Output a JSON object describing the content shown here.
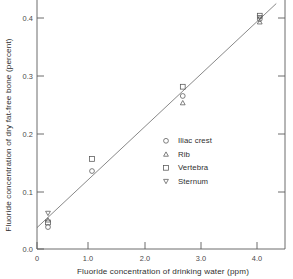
{
  "chart_data": {
    "type": "scatter",
    "title": "",
    "xlabel": "Fluoride concentration of drinking water (ppm)",
    "ylabel": "Fluoride concentration of dry fat-free bone (percent)",
    "xlim": [
      0,
      4.35
    ],
    "ylim": [
      0.0,
      0.425
    ],
    "xticks": [
      0,
      1.0,
      2.0,
      3.0,
      4.0
    ],
    "xticklabels": [
      "0",
      "1.0",
      "2.0",
      "3.0",
      "4.0"
    ],
    "yticks": [
      0.0,
      0.1,
      0.2,
      0.3,
      0.4
    ],
    "yticklabels": [
      "0.0",
      "0.1",
      "0.2",
      "0.3",
      "0.4"
    ],
    "grid": false,
    "legend_position": "center-right",
    "series": [
      {
        "name": "Iliac crest",
        "marker": "circle",
        "points": [
          [
            0.2,
            0.038
          ],
          [
            1.0,
            0.135
          ],
          [
            2.65,
            0.265
          ],
          [
            4.05,
            0.398
          ]
        ]
      },
      {
        "name": "Rib",
        "marker": "triangle-up",
        "points": [
          [
            0.2,
            0.05
          ],
          [
            2.65,
            0.253
          ],
          [
            4.05,
            0.393
          ]
        ]
      },
      {
        "name": "Vertebra",
        "marker": "square",
        "points": [
          [
            0.2,
            0.046
          ],
          [
            1.0,
            0.156
          ],
          [
            2.65,
            0.281
          ],
          [
            4.05,
            0.404
          ]
        ]
      },
      {
        "name": "Sternum",
        "marker": "triangle-down",
        "points": [
          [
            0.2,
            0.062
          ],
          [
            4.05,
            0.401
          ]
        ]
      }
    ],
    "fit_line": {
      "type": "line",
      "x": [
        0.0,
        4.35
      ],
      "y": [
        0.037,
        0.425
      ]
    }
  },
  "axes": {
    "x_title": "Fluoride concentration of drinking water (ppm)",
    "y_title": "Fluoride concentration of dry fat-free bone (percent)",
    "x_tick_labels": [
      "0",
      "1.0",
      "2.0",
      "3.0",
      "4.0"
    ],
    "y_tick_labels": [
      "0.0",
      "0.1",
      "0.2",
      "0.3",
      "0.4"
    ]
  },
  "legend": {
    "items": [
      {
        "label": "Iliac crest",
        "marker": "circle-marker-icon"
      },
      {
        "label": "Rib",
        "marker": "triangle-up-marker-icon"
      },
      {
        "label": "Vertebra",
        "marker": "square-marker-icon"
      },
      {
        "label": "Sternum",
        "marker": "triangle-down-marker-icon"
      }
    ]
  },
  "colors": {
    "axis": "#5c5c5c",
    "marker": "#555555",
    "fit_line": "#6a6a6a",
    "text": "#2f2f2f",
    "background": "#ffffff"
  }
}
